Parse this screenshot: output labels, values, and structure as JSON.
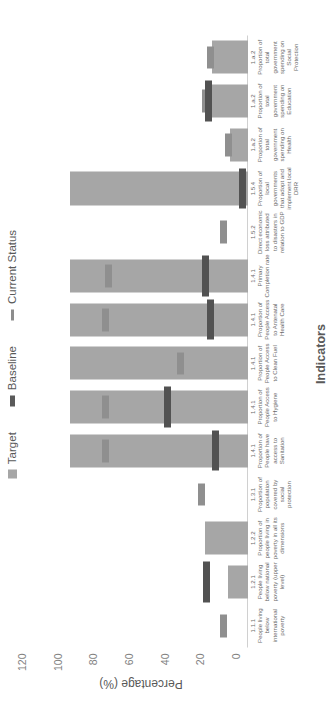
{
  "chart_data": {
    "type": "bar",
    "title": "",
    "xlabel": "Indicators",
    "ylabel": "Percentage (%)",
    "ylim": [
      0,
      120
    ],
    "yticks": [
      0,
      20,
      40,
      60,
      80,
      100,
      120
    ],
    "grid": false,
    "legend_position": "top",
    "legend": [
      {
        "name": "Target",
        "marker": "square",
        "color": "#a6a6a6"
      },
      {
        "name": "Baseline",
        "marker": "line",
        "color": "#525252"
      },
      {
        "name": "Current Status",
        "marker": "line",
        "color": "#8f8f8f"
      }
    ],
    "categories": [
      {
        "code": "1.1.1",
        "text": "People living below international poverty"
      },
      {
        "code": "1.2.1",
        "text": "People living below national poverty (upper level)"
      },
      {
        "code": "1.2.2",
        "text": "Proportion of people living in poverty in all its dimensions"
      },
      {
        "code": "1.3.1",
        "text": "Proportion of population covered by social protection"
      },
      {
        "code": "1.4.1",
        "text": "Proportion of People have access to Sanitation"
      },
      {
        "code": "1.4.1",
        "text": "Proportion of People Access to Hygiene"
      },
      {
        "code": "1.4.1",
        "text": "Proportion of People Access to Clean Fuel"
      },
      {
        "code": "1.4.1",
        "text": "Proportion of People Access to Antenatal Health Care"
      },
      {
        "code": "1.4.1",
        "text": "Primary Completion rate"
      },
      {
        "code": "1.5.2",
        "text": "Direct economic loss attributed to disasters in relation to GDP"
      },
      {
        "code": "1.5.4",
        "text": "Proportion of local governments that adopt and implement local DRR"
      },
      {
        "code": "1.a.2",
        "text": "Proportion of total government spending on Health"
      },
      {
        "code": "1.a.2",
        "text": "Proportion of total government spending on Education"
      },
      {
        "code": "1.a.2",
        "text": "Proportion of total government spending on Social Protection"
      }
    ],
    "series": [
      {
        "name": "Target",
        "values": [
          0,
          11,
          24,
          0,
          100,
          100,
          100,
          100,
          100,
          0,
          100,
          10,
          21,
          20
        ]
      },
      {
        "name": "Baseline",
        "values": [
          null,
          23,
          null,
          null,
          18,
          45,
          null,
          21,
          24,
          null,
          3,
          null,
          22,
          null
        ]
      },
      {
        "name": "Current Status",
        "values": [
          14,
          null,
          null,
          26,
          80,
          80,
          38,
          80,
          78,
          14,
          3,
          11,
          24,
          21
        ]
      }
    ]
  }
}
